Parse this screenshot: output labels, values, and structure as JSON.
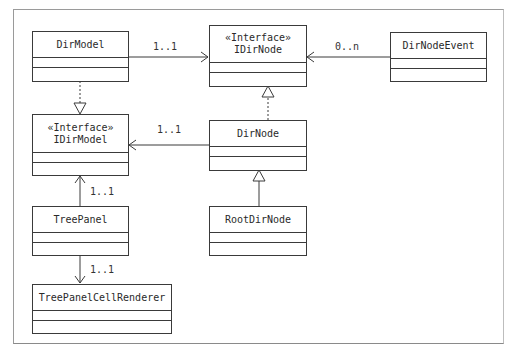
{
  "diagram": {
    "type": "UML class diagram",
    "classes": {
      "dir_model": {
        "name": "DirModel"
      },
      "idir_node": {
        "stereotype": "«Interface»",
        "name": "IDirNode"
      },
      "dir_node_event": {
        "name": "DirNodeEvent"
      },
      "idir_model": {
        "stereotype": "«Interface»",
        "name": "IDirModel"
      },
      "dir_node": {
        "name": "DirNode"
      },
      "root_dir_node": {
        "name": "RootDirNode"
      },
      "tree_panel": {
        "name": "TreePanel"
      },
      "tree_panel_cell_renderer": {
        "name": "TreePanelCellRenderer"
      }
    },
    "relations": [
      {
        "from": "DirModel",
        "to": "IDirNode",
        "kind": "association",
        "multiplicity": "1..1"
      },
      {
        "from": "DirNodeEvent",
        "to": "IDirNode",
        "kind": "association",
        "multiplicity": "0..n"
      },
      {
        "from": "DirModel",
        "to": "IDirModel",
        "kind": "realization"
      },
      {
        "from": "DirNode",
        "to": "IDirNode",
        "kind": "realization"
      },
      {
        "from": "DirNode",
        "to": "IDirModel",
        "kind": "association",
        "multiplicity": "1..1"
      },
      {
        "from": "RootDirNode",
        "to": "DirNode",
        "kind": "generalization"
      },
      {
        "from": "TreePanel",
        "to": "IDirModel",
        "kind": "association",
        "multiplicity": "1..1"
      },
      {
        "from": "TreePanel",
        "to": "TreePanelCellRenderer",
        "kind": "association",
        "multiplicity": "1..1"
      }
    ],
    "labels": {
      "dirmodel_idirnode": "1..1",
      "event_idirnode": "0..n",
      "dirnode_idirmodel": "1..1",
      "treepanel_idirmodel": "1..1",
      "treepanel_renderer": "1..1"
    },
    "colors": {
      "line": "#3a3a3a",
      "frame": "#9a9a9a",
      "background": "#ffffff"
    }
  }
}
